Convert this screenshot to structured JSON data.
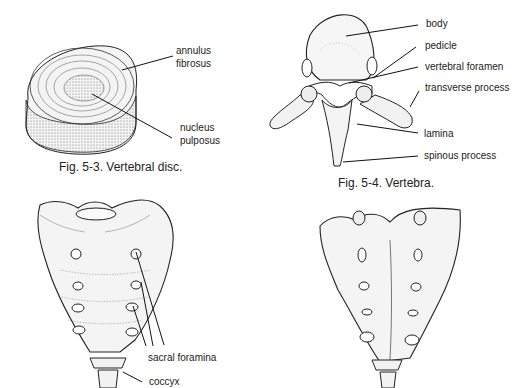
{
  "figures": [
    {
      "id": "fig-5-3",
      "caption": "Fig. 5-3. Vertebral disc.",
      "labels": [
        "annulus",
        "fibrosus",
        "nucleus",
        "pulposus"
      ]
    },
    {
      "id": "fig-5-4",
      "caption": "Fig. 5-4. Vertebra.",
      "labels": [
        "body",
        "pedicle",
        "vertebral foramen",
        "transverse process",
        "lamina",
        "spinous process"
      ]
    },
    {
      "id": "sacrum-anterior",
      "caption": "",
      "labels": [
        "sacral foramina",
        "coccyx"
      ]
    },
    {
      "id": "sacrum-posterior",
      "caption": "",
      "labels": []
    }
  ]
}
